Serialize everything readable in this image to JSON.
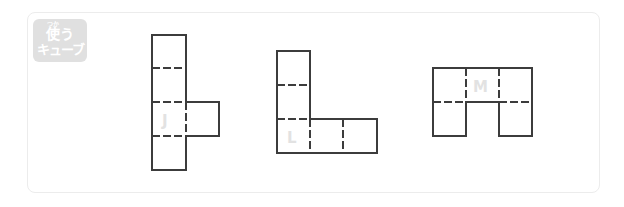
{
  "badge": {
    "ruby": "つか",
    "line1": "使う",
    "line2": "キューブ"
  },
  "figures": [
    {
      "label": "J",
      "shape": "cube-net-T"
    },
    {
      "label": "L",
      "shape": "cube-net-L"
    },
    {
      "label": "M",
      "shape": "cube-net-M"
    }
  ],
  "colors": {
    "line": "#3c3c3c",
    "label": "#e2e2e2",
    "badge_bg": "#e0e0e0",
    "frame_border": "#ececec"
  }
}
